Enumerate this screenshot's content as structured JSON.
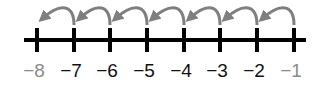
{
  "diagram": {
    "type": "number-line",
    "ticks": [
      {
        "value": -8,
        "label": "−8",
        "x": 37,
        "muted": true
      },
      {
        "value": -7,
        "label": "−7",
        "x": 74,
        "muted": false
      },
      {
        "value": -6,
        "label": "−6",
        "x": 110,
        "muted": false
      },
      {
        "value": -5,
        "label": "−5",
        "x": 147,
        "muted": false
      },
      {
        "value": -4,
        "label": "−4",
        "x": 184,
        "muted": false
      },
      {
        "value": -3,
        "label": "−3",
        "x": 220,
        "muted": false
      },
      {
        "value": -2,
        "label": "−2",
        "x": 257,
        "muted": false
      },
      {
        "value": -1,
        "label": "−1",
        "x": 294,
        "muted": true
      }
    ],
    "jumps": [
      {
        "from": -1,
        "to": -2
      },
      {
        "from": -2,
        "to": -3
      },
      {
        "from": -3,
        "to": -4
      },
      {
        "from": -4,
        "to": -5
      },
      {
        "from": -5,
        "to": -6
      },
      {
        "from": -6,
        "to": -7
      },
      {
        "from": -7,
        "to": -8
      }
    ],
    "colors": {
      "line": "#000000",
      "label": "#111111",
      "muted_label": "#8a8a8a",
      "arrow": "#7f7f7f"
    }
  }
}
